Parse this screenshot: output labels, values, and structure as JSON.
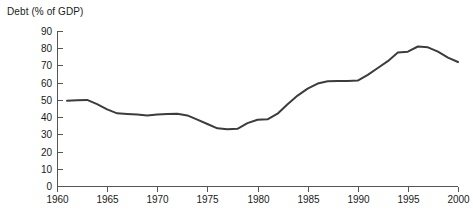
{
  "chart_data": {
    "type": "line",
    "title": "Debt (% of GDP)",
    "xlabel": "",
    "ylabel": "",
    "grid": false,
    "legend": null,
    "xlim": [
      1960,
      2000
    ],
    "ylim": [
      0,
      90
    ],
    "yticks": [
      0,
      10,
      20,
      30,
      40,
      50,
      60,
      70,
      80,
      90
    ],
    "ytick_labels": [
      "0",
      "10",
      "20",
      "30",
      "40",
      "50",
      "60",
      "70",
      "80",
      "90"
    ],
    "xticks": [
      1960,
      1965,
      1970,
      1975,
      1980,
      1985,
      1990,
      1995,
      2000
    ],
    "xtick_labels": [
      "1960",
      "1965",
      "1970",
      "1975",
      "1980",
      "1985",
      "1990",
      "1995",
      "2000"
    ],
    "series": [
      {
        "name": "Debt (% of GDP)",
        "color": "#3c3c3c",
        "x": [
          1961,
          1962,
          1963,
          1964,
          1965,
          1966,
          1967,
          1968,
          1969,
          1970,
          1971,
          1972,
          1973,
          1974,
          1975,
          1976,
          1977,
          1978,
          1979,
          1980,
          1981,
          1982,
          1983,
          1984,
          1985,
          1986,
          1987,
          1988,
          1989,
          1990,
          1991,
          1992,
          1993,
          1994,
          1995,
          1996,
          1997,
          1998,
          1999,
          2000
        ],
        "values": [
          49.5,
          49.8,
          50.0,
          47.5,
          44.5,
          42.2,
          41.8,
          41.5,
          41.0,
          41.5,
          41.8,
          42.0,
          41.0,
          38.5,
          36.0,
          33.5,
          33.0,
          33.2,
          36.5,
          38.5,
          38.7,
          42.0,
          47.5,
          52.5,
          56.5,
          59.5,
          60.8,
          61.0,
          61.0,
          61.2,
          64.5,
          68.5,
          72.5,
          77.5,
          78.0,
          81.0,
          80.5,
          78.0,
          74.5,
          72.0
        ]
      }
    ]
  },
  "layout": {
    "plot_left_px": 57,
    "plot_right_px": 458,
    "plot_top_px": 31,
    "plot_bottom_px": 186
  }
}
